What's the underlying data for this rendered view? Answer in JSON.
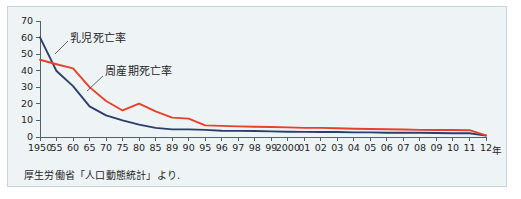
{
  "figure": {
    "background_color": "#eef3f5",
    "border_color": "#c9d4da",
    "source_note": "厚生労働省「人口動態統計」より.",
    "axis_unit_label": "年"
  },
  "chart_data": {
    "type": "line",
    "title": "",
    "subtitle": "",
    "xlabel": "年",
    "ylabel": "",
    "ylim": [
      0,
      70
    ],
    "yticks": [
      0,
      10,
      20,
      30,
      40,
      50,
      60,
      70
    ],
    "ytick_labels": [
      "0",
      "10",
      "20",
      "30",
      "40",
      "50",
      "60",
      "70"
    ],
    "grid": false,
    "legend_position": "inline-annotation",
    "categories": [
      "1950",
      "55",
      "60",
      "65",
      "70",
      "75",
      "80",
      "85",
      "89",
      "90",
      "95",
      "96",
      "97",
      "98",
      "99",
      "2000",
      "01",
      "02",
      "03",
      "04",
      "05",
      "06",
      "07",
      "08",
      "09",
      "10",
      "11",
      "12"
    ],
    "series": [
      {
        "name": "乳児死亡率",
        "color": "#2b3f6b",
        "values": [
          60.1,
          39.8,
          30.7,
          18.5,
          13.1,
          10.0,
          7.5,
          5.5,
          4.6,
          4.6,
          4.3,
          3.8,
          3.7,
          3.6,
          3.4,
          3.2,
          3.1,
          3.0,
          3.0,
          2.8,
          2.8,
          2.6,
          2.6,
          2.6,
          2.4,
          2.3,
          2.3,
          0.8
        ]
      },
      {
        "name": "周産期死亡率",
        "color": "#e8402a",
        "values": [
          46.6,
          43.9,
          41.4,
          30.1,
          21.7,
          16.0,
          20.2,
          15.4,
          11.7,
          11.1,
          7.0,
          6.7,
          6.4,
          6.2,
          6.0,
          5.8,
          5.5,
          5.5,
          5.3,
          5.0,
          4.8,
          4.7,
          4.5,
          4.3,
          4.2,
          4.2,
          4.1,
          1.0
        ]
      }
    ],
    "annotations": [
      {
        "text": "乳児死亡率",
        "target_series": "乳児死亡率"
      },
      {
        "text": "周産期死亡率",
        "target_series": "周産期死亡率"
      }
    ]
  }
}
